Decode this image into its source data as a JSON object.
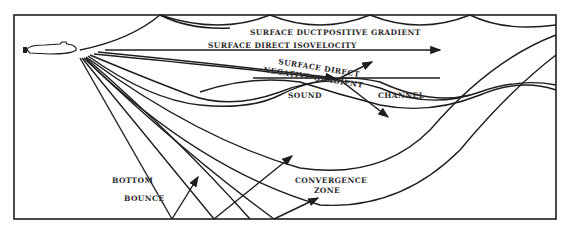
{
  "figure": {
    "labels": {
      "surface_duct": "SURFACE DUCT",
      "positive_gradient": "POSITIVE GRADIENT",
      "surface_direct_isovelocity": "SURFACE DIRECT ISOVELOCITY",
      "surface_direct": "SURFACE DIRECT",
      "negative_gradient": "NEGATIVE GRADIENT",
      "sound": "SOUND",
      "channel": "CHANNEL",
      "bottom": "BOTTOM",
      "bounce": "BOUNCE",
      "convergence": "CONVERGENCE",
      "zone": "ZONE"
    },
    "colors": {
      "line": "#1e1e1e",
      "background": "#ffffff"
    }
  }
}
